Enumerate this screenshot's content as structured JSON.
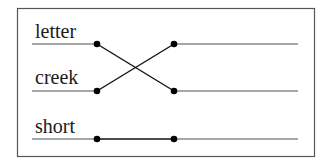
{
  "diagram": {
    "type": "matching-exercise",
    "words": [
      {
        "label": "letter",
        "y": 44
      },
      {
        "label": "creek",
        "y": 91
      },
      {
        "label": "short",
        "y": 139
      }
    ],
    "connections": [
      {
        "from": "letter",
        "to_row": 2
      },
      {
        "from": "creek",
        "to_row": 1
      },
      {
        "from": "short",
        "to_row": 3
      }
    ],
    "colors": {
      "border": "#555555",
      "guide_line": "#8a8a8a",
      "connector": "#111111",
      "dot": "#000000"
    }
  }
}
